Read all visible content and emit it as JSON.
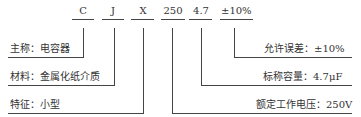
{
  "codes": [
    "C",
    "J",
    "X",
    "250",
    "4.7",
    "±10%"
  ],
  "left_labels": [
    {
      "key": "主称",
      "value": "电容器"
    },
    {
      "key": "材料",
      "value": "金属化纸介质"
    },
    {
      "key": "特征",
      "value": "小型"
    }
  ],
  "right_labels": [
    {
      "key": "允许误差",
      "value": "±10%"
    },
    {
      "key": "标称容量",
      "value": "4.7μF"
    },
    {
      "key": "额定工作电压",
      "value": "250V"
    }
  ],
  "text": {
    "l0": "主称：电容器",
    "l1": "材料：金属化纸介质",
    "l2": "特征：小型",
    "r0": "允许误差：±10%",
    "r1": "标称容量：4.7μF",
    "r2": "额定工作电压：250V"
  }
}
